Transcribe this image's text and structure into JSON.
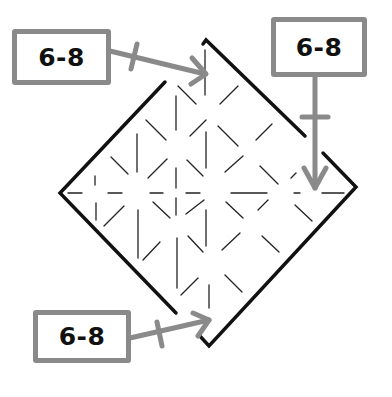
{
  "diagram": {
    "type": "origami-fold-step",
    "colors": {
      "outline": "#111111",
      "crease": "#222222",
      "arrow": "#8a8a8a",
      "box_border": "#8a8a8a",
      "label_text": "#111111"
    },
    "callouts": [
      {
        "id": "top-left",
        "label": "6-8",
        "arrow_direction": "right-down"
      },
      {
        "id": "top-right",
        "label": "6-8",
        "arrow_direction": "down"
      },
      {
        "id": "bottom-left",
        "label": "6-8",
        "arrow_direction": "right-up"
      }
    ]
  }
}
